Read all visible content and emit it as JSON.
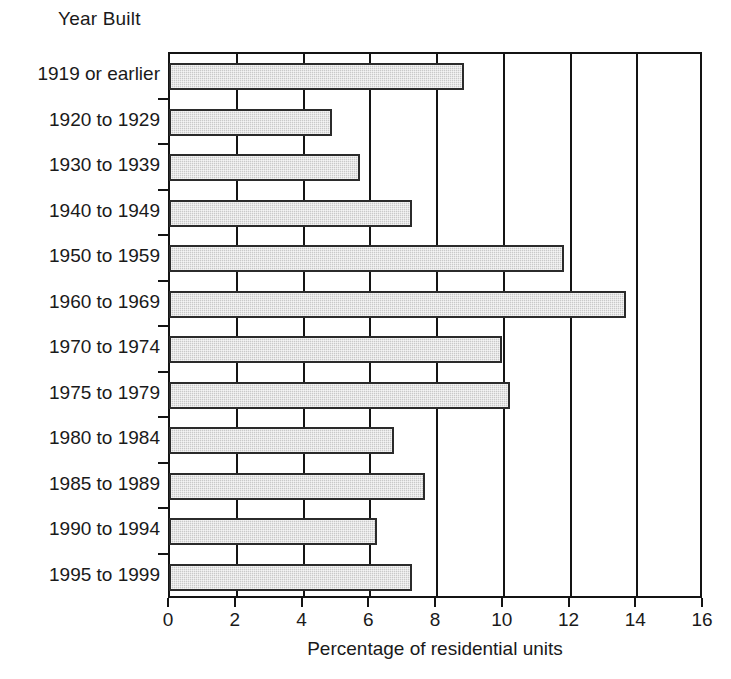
{
  "chart_data": {
    "type": "bar",
    "orientation": "horizontal",
    "title": "",
    "xlabel": "Percentage of residential units",
    "ylabel": "Year Built",
    "xlim": [
      0,
      16
    ],
    "xticks": [
      0,
      2,
      4,
      6,
      8,
      10,
      12,
      14,
      16
    ],
    "xtick_labels": [
      "0",
      "2",
      "4",
      "6",
      "8",
      "10",
      "12",
      "14",
      "16"
    ],
    "grid": "vertical",
    "legend": "none",
    "categories": [
      "1919 or earlier",
      "1920 to 1929",
      "1930 to 1939",
      "1940 to 1949",
      "1950 to 1959",
      "1960 to 1969",
      "1970 to 1974",
      "1975 to 1979",
      "1980 to 1984",
      "1985 to 1989",
      "1990 to 1994",
      "1995 to 1999"
    ],
    "values": [
      8.8,
      4.85,
      5.7,
      7.25,
      11.8,
      13.65,
      9.95,
      10.2,
      6.7,
      7.65,
      6.2,
      7.25
    ],
    "bar_fill": "#c9c9c9",
    "bar_edge": "#2b2b2b",
    "axis_color": "#141414"
  }
}
